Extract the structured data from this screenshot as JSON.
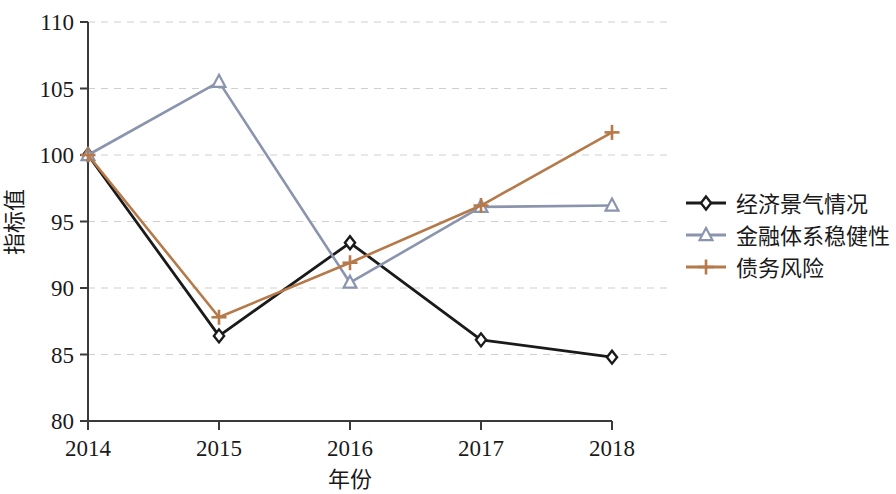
{
  "chart_data": {
    "type": "line",
    "title": "",
    "xlabel": "年份",
    "ylabel": "指标值",
    "categories": [
      "2014",
      "2015",
      "2016",
      "2017",
      "2018"
    ],
    "x": [
      2014,
      2015,
      2016,
      2017,
      2018
    ],
    "xlim": [
      2014,
      2018
    ],
    "ylim": [
      80,
      110
    ],
    "yticks": [
      "80",
      "85",
      "90",
      "95",
      "100",
      "105",
      "110"
    ],
    "ytick_values": [
      80,
      85,
      90,
      95,
      100,
      105,
      110
    ],
    "grid": "horizontal-dashed",
    "legend_position": "right",
    "series": [
      {
        "name": "经济景气情况",
        "color": "#1a1a1a",
        "marker": "diamond",
        "values": [
          100.0,
          86.4,
          93.4,
          86.1,
          84.8
        ]
      },
      {
        "name": "金融体系稳健性",
        "color": "#8a94ad",
        "marker": "triangle",
        "values": [
          100.0,
          105.5,
          90.4,
          96.1,
          96.2
        ]
      },
      {
        "name": "债务风险",
        "color": "#b5794a",
        "marker": "plus",
        "values": [
          100.0,
          87.8,
          91.9,
          96.2,
          101.7
        ]
      }
    ]
  },
  "axis": {
    "x_tick_labels": [
      "2014",
      "2015",
      "2016",
      "2017",
      "2018"
    ],
    "y_tick_labels": [
      "110",
      "105",
      "100",
      "95",
      "90",
      "85",
      "80"
    ],
    "x_axis_title": "年份",
    "y_axis_title": "指标值"
  },
  "legend": {
    "entries": [
      {
        "label": "经济景气情况",
        "color": "#1a1a1a",
        "marker": "diamond-marker"
      },
      {
        "label": "金融体系稳健性",
        "color": "#8a94ad",
        "marker": "triangle-marker"
      },
      {
        "label": "债务风险",
        "color": "#b5794a",
        "marker": "plus-marker"
      }
    ]
  },
  "colors": {
    "axis": "#3a3a3a",
    "grid": "#cfcfcf",
    "series_1": "#1a1a1a",
    "series_2": "#8a94ad",
    "series_3": "#b5794a",
    "background": "#ffffff"
  }
}
